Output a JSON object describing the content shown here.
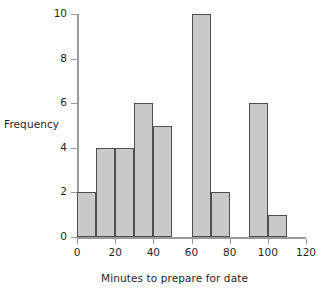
{
  "chart_data": {
    "type": "bar",
    "title": "",
    "subtitle": "",
    "xlabel": "Minutes to prepare for date",
    "ylabel": "Frequency",
    "xlim": [
      0,
      120
    ],
    "ylim": [
      0,
      10
    ],
    "bin_width": 10,
    "grid": false,
    "legend": null,
    "x_ticks": [
      0,
      20,
      40,
      60,
      80,
      100,
      120
    ],
    "x_tick_labels": [
      "0",
      "20",
      "40",
      "60",
      "80",
      "100",
      "120"
    ],
    "y_ticks": [
      0,
      2,
      4,
      6,
      8,
      10
    ],
    "y_tick_labels": [
      "0",
      "2",
      "4",
      "6",
      "8",
      "10"
    ],
    "bin_edges": [
      0,
      10,
      20,
      30,
      40,
      50,
      60,
      70,
      80,
      90,
      100,
      110,
      120
    ],
    "categories": [
      "0-10",
      "10-20",
      "20-30",
      "30-40",
      "40-50",
      "50-60",
      "60-70",
      "70-80",
      "80-90",
      "90-100",
      "100-110",
      "110-120"
    ],
    "values": [
      2,
      4,
      4,
      6,
      5,
      0,
      10,
      2,
      0,
      6,
      1,
      0
    ],
    "bar_fill_color": "#c9c9c9",
    "bar_edge_color": "#4f4f4f",
    "axis_color": "#9a9a9a",
    "text_color": "#1f1f1f",
    "background_color": "#ffffff"
  }
}
